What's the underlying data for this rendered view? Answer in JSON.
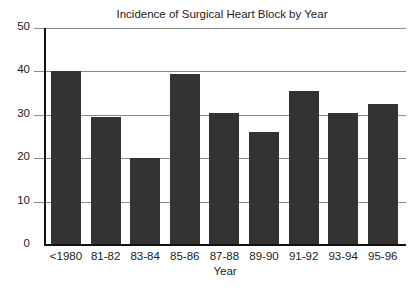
{
  "chart_data": {
    "type": "bar",
    "title": "Incidence of Surgical Heart Block by Year",
    "xlabel": "Year",
    "ylabel": "",
    "categories": [
      "<1980",
      "81-82",
      "83-84",
      "85-86",
      "87-88",
      "89-90",
      "91-92",
      "93-94",
      "95-96"
    ],
    "values": [
      40,
      29.5,
      20,
      39.5,
      30.5,
      26,
      35.5,
      30.5,
      32.5
    ],
    "ylim": [
      0,
      50
    ],
    "yticks": [
      0,
      10,
      20,
      30,
      40,
      50
    ],
    "ytick_labels": [
      "0",
      "10",
      "20",
      "30",
      "40",
      "50"
    ],
    "grid": true,
    "legend": null,
    "colors": {
      "bar": "#333333",
      "grid": "#8a8a8a",
      "axis": "#111111"
    }
  }
}
